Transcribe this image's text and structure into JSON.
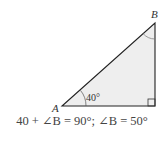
{
  "diagram": {
    "type": "right-triangle",
    "vertices": {
      "A": "A",
      "B": "B"
    },
    "angle_A_label": "40°",
    "right_angle_at": "C (unlabeled, bottom-right)",
    "fill_color": "#eeeeee",
    "stroke_color": "#222222"
  },
  "equation": "40 + ∠B = 90°; ∠B = 50°"
}
